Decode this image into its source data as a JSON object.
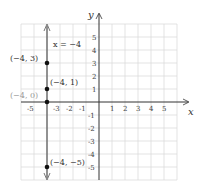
{
  "graph": {
    "axis_labels": {
      "x": "x",
      "y": "y"
    },
    "x_ticks": [
      "-5",
      "-3",
      "-2",
      "-1",
      "1",
      "2",
      "3",
      "4",
      "5"
    ],
    "y_ticks_positive": [
      "5",
      "4",
      "3",
      "2",
      "1"
    ],
    "y_ticks_negative": [
      "-1",
      "-2",
      "-3",
      "-4",
      "-5"
    ],
    "line_equation": "x = −4",
    "points": [
      {
        "label": "(−4, 3)",
        "x": -4,
        "y": 3
      },
      {
        "label": "(−4, 1)",
        "x": -4,
        "y": 1
      },
      {
        "label": "(−4, 0)",
        "x": -4,
        "y": 0
      },
      {
        "label": "(−4, −5)",
        "x": -4,
        "y": -5
      }
    ],
    "colors": {
      "grid": "#dcdcdc",
      "axis": "#333333",
      "line": "#777777",
      "point": "#111111",
      "muted_label": "#999999"
    }
  }
}
